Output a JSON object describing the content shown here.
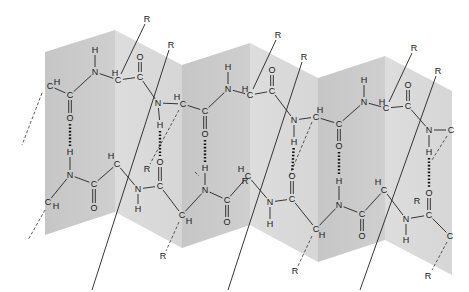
{
  "diagram": {
    "colors": {
      "panel_dark": "#c6c6c6",
      "panel_light": "#dddddd",
      "ink": "#1a1a1a",
      "background": "#ffffff"
    },
    "atom_labels": [
      "C",
      "H",
      "N",
      "O",
      "R"
    ],
    "side_chain_label": "R",
    "panels": [
      {
        "x0": 45,
        "x1": 115,
        "top0": 52,
        "top1": 30,
        "bot0": 235,
        "bot1": 212,
        "shade": "dark"
      },
      {
        "x0": 115,
        "x1": 182,
        "top0": 30,
        "top1": 65,
        "bot0": 212,
        "bot1": 248,
        "shade": "light"
      },
      {
        "x0": 182,
        "x1": 250,
        "top0": 65,
        "top1": 43,
        "bot0": 248,
        "bot1": 225,
        "shade": "dark"
      },
      {
        "x0": 250,
        "x1": 318,
        "top0": 43,
        "top1": 78,
        "bot0": 225,
        "bot1": 262,
        "shade": "light"
      },
      {
        "x0": 318,
        "x1": 385,
        "top0": 78,
        "top1": 56,
        "bot0": 262,
        "bot1": 240,
        "shade": "dark"
      },
      {
        "x0": 385,
        "x1": 452,
        "top0": 56,
        "top1": 91,
        "bot0": 240,
        "bot1": 275,
        "shade": "light"
      }
    ],
    "atoms": [
      {
        "id": "a1",
        "t": "C",
        "x": 50,
        "y": 86
      },
      {
        "id": "a1h",
        "t": "H",
        "x": 57,
        "y": 82
      },
      {
        "id": "a2",
        "t": "C",
        "x": 70,
        "y": 95
      },
      {
        "id": "a3",
        "t": "O",
        "x": 70,
        "y": 118
      },
      {
        "id": "a4",
        "t": "H",
        "x": 95,
        "y": 50
      },
      {
        "id": "a5",
        "t": "N",
        "x": 95,
        "y": 72
      },
      {
        "id": "a6h",
        "t": "H",
        "x": 115,
        "y": 73
      },
      {
        "id": "a6",
        "t": "C",
        "x": 118,
        "y": 80
      },
      {
        "id": "a7",
        "t": "O",
        "x": 140,
        "y": 57
      },
      {
        "id": "a8",
        "t": "C",
        "x": 140,
        "y": 77
      },
      {
        "id": "a9",
        "t": "N",
        "x": 158,
        "y": 103
      },
      {
        "id": "a10",
        "t": "H",
        "x": 160,
        "y": 125
      },
      {
        "id": "a11h",
        "t": "H",
        "x": 177,
        "y": 97
      },
      {
        "id": "a11",
        "t": "C",
        "x": 183,
        "y": 104
      },
      {
        "id": "a12",
        "t": "C",
        "x": 205,
        "y": 111
      },
      {
        "id": "a13",
        "t": "O",
        "x": 205,
        "y": 134
      },
      {
        "id": "a14",
        "t": "H",
        "x": 228,
        "y": 67
      },
      {
        "id": "a15",
        "t": "N",
        "x": 228,
        "y": 89
      },
      {
        "id": "a16h",
        "t": "H",
        "x": 245,
        "y": 89
      },
      {
        "id": "a16",
        "t": "C",
        "x": 250,
        "y": 95
      },
      {
        "id": "a17",
        "t": "O",
        "x": 272,
        "y": 70
      },
      {
        "id": "a18",
        "t": "C",
        "x": 272,
        "y": 91
      },
      {
        "id": "a19",
        "t": "N",
        "x": 294,
        "y": 120
      },
      {
        "id": "a20",
        "t": "H",
        "x": 294,
        "y": 142
      },
      {
        "id": "a21h",
        "t": "H",
        "x": 320,
        "y": 110
      },
      {
        "id": "a21",
        "t": "C",
        "x": 316,
        "y": 117
      },
      {
        "id": "a22",
        "t": "C",
        "x": 339,
        "y": 124
      },
      {
        "id": "a23",
        "t": "O",
        "x": 339,
        "y": 146
      },
      {
        "id": "a24",
        "t": "H",
        "x": 364,
        "y": 80
      },
      {
        "id": "a25",
        "t": "N",
        "x": 364,
        "y": 102
      },
      {
        "id": "a26h",
        "t": "H",
        "x": 382,
        "y": 102
      },
      {
        "id": "a26",
        "t": "C",
        "x": 386,
        "y": 108
      },
      {
        "id": "a27",
        "t": "O",
        "x": 408,
        "y": 85
      },
      {
        "id": "a28",
        "t": "C",
        "x": 408,
        "y": 106
      },
      {
        "id": "a29",
        "t": "N",
        "x": 429,
        "y": 130
      },
      {
        "id": "a29c",
        "t": "C",
        "x": 451,
        "y": 130
      },
      {
        "id": "a30",
        "t": "H",
        "x": 429,
        "y": 152
      },
      {
        "id": "b1",
        "t": "H",
        "x": 70,
        "y": 152
      },
      {
        "id": "b2",
        "t": "N",
        "x": 70,
        "y": 175
      },
      {
        "id": "b3",
        "t": "C",
        "x": 48,
        "y": 202
      },
      {
        "id": "b3h",
        "t": "H",
        "x": 56,
        "y": 206
      },
      {
        "id": "b4",
        "t": "C",
        "x": 94,
        "y": 184
      },
      {
        "id": "b5",
        "t": "O",
        "x": 94,
        "y": 208
      },
      {
        "id": "b6h",
        "t": "H",
        "x": 111,
        "y": 156
      },
      {
        "id": "b6",
        "t": "C",
        "x": 117,
        "y": 164
      },
      {
        "id": "b7",
        "t": "N",
        "x": 138,
        "y": 189
      },
      {
        "id": "b8",
        "t": "H",
        "x": 138,
        "y": 209
      },
      {
        "id": "b9",
        "t": "O",
        "x": 160,
        "y": 162
      },
      {
        "id": "b10",
        "t": "C",
        "x": 160,
        "y": 186
      },
      {
        "id": "b11",
        "t": "C",
        "x": 182,
        "y": 215
      },
      {
        "id": "b11h",
        "t": "H",
        "x": 189,
        "y": 221
      },
      {
        "id": "b12",
        "t": "H",
        "x": 205,
        "y": 168
      },
      {
        "id": "b13",
        "t": "N",
        "x": 205,
        "y": 190
      },
      {
        "id": "b14",
        "t": "C",
        "x": 227,
        "y": 200
      },
      {
        "id": "b15",
        "t": "O",
        "x": 227,
        "y": 222
      },
      {
        "id": "b16h",
        "t": "H",
        "x": 241,
        "y": 169
      },
      {
        "id": "b16",
        "t": "C",
        "x": 248,
        "y": 176
      },
      {
        "id": "b17",
        "t": "N",
        "x": 270,
        "y": 202
      },
      {
        "id": "b18",
        "t": "H",
        "x": 270,
        "y": 224
      },
      {
        "id": "b19",
        "t": "O",
        "x": 292,
        "y": 176
      },
      {
        "id": "b20",
        "t": "C",
        "x": 292,
        "y": 199
      },
      {
        "id": "b21",
        "t": "C",
        "x": 316,
        "y": 229
      },
      {
        "id": "b21h",
        "t": "H",
        "x": 322,
        "y": 235
      },
      {
        "id": "b22",
        "t": "H",
        "x": 339,
        "y": 181
      },
      {
        "id": "b23",
        "t": "N",
        "x": 339,
        "y": 205
      },
      {
        "id": "b24",
        "t": "C",
        "x": 362,
        "y": 214
      },
      {
        "id": "b25",
        "t": "O",
        "x": 362,
        "y": 236
      },
      {
        "id": "b26h",
        "t": "H",
        "x": 378,
        "y": 182
      },
      {
        "id": "b26",
        "t": "C",
        "x": 384,
        "y": 190
      },
      {
        "id": "b27",
        "t": "N",
        "x": 406,
        "y": 219
      },
      {
        "id": "b28",
        "t": "H",
        "x": 406,
        "y": 240
      },
      {
        "id": "b29",
        "t": "O",
        "x": 429,
        "y": 193
      },
      {
        "id": "b30",
        "t": "C",
        "x": 429,
        "y": 215
      },
      {
        "id": "b31",
        "t": "C",
        "x": 450,
        "y": 236
      }
    ],
    "r_groups": [
      {
        "x": 147,
        "y": 19
      },
      {
        "x": 171,
        "y": 45
      },
      {
        "x": 278,
        "y": 35
      },
      {
        "x": 304,
        "y": 57
      },
      {
        "x": 414,
        "y": 48
      },
      {
        "x": 438,
        "y": 71
      },
      {
        "x": 147,
        "y": 169
      },
      {
        "x": 193,
        "y": 197
      },
      {
        "x": 285,
        "y": 182
      },
      {
        "x": 163,
        "y": 256
      },
      {
        "x": 295,
        "y": 271
      },
      {
        "x": 428,
        "y": 276
      },
      {
        "x": 245,
        "y": 272
      }
    ]
  }
}
